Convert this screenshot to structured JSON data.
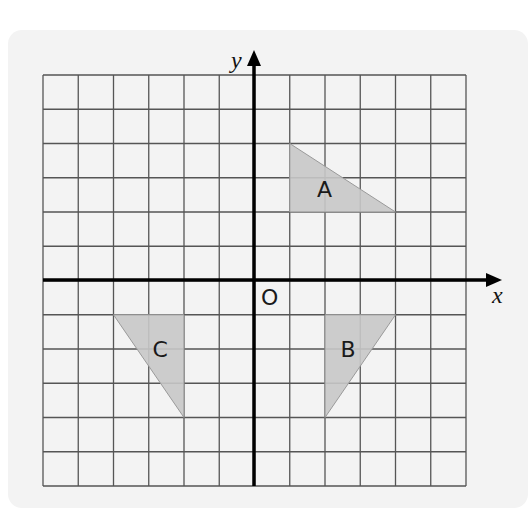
{
  "diagram": {
    "type": "coordinate-grid",
    "x_axis_label": "x",
    "y_axis_label": "y",
    "origin_label": "O",
    "x_range": [
      -6,
      6
    ],
    "y_range": [
      -6,
      6
    ],
    "grid_step": 1,
    "shape_fill": "#c8c8c8",
    "shape_stroke": "#9a9a9a",
    "shapes": [
      {
        "label": "A",
        "vertices": [
          [
            1,
            4
          ],
          [
            1,
            2
          ],
          [
            4,
            2
          ]
        ]
      },
      {
        "label": "B",
        "vertices": [
          [
            2,
            -1
          ],
          [
            4,
            -1
          ],
          [
            2,
            -4
          ]
        ]
      },
      {
        "label": "C",
        "vertices": [
          [
            -4,
            -1
          ],
          [
            -2,
            -1
          ],
          [
            -2,
            -4
          ]
        ]
      }
    ]
  }
}
